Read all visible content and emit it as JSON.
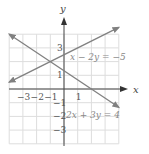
{
  "chart_data": {
    "type": "line",
    "title": "",
    "xlabel": "x",
    "ylabel": "y",
    "xlim": [
      -4,
      4
    ],
    "ylim": [
      -4,
      4
    ],
    "grid": true,
    "x_ticks": [
      "-3",
      "-2",
      "-1",
      "1"
    ],
    "y_ticks": [
      "3",
      "1",
      "-1",
      "-2",
      "-3"
    ],
    "series": [
      {
        "name": "x - 2y = -5",
        "label": "x − 2y = −5",
        "slope": 0.5,
        "intercept": 2.5,
        "x": [
          -4,
          4
        ],
        "y": [
          0.5,
          4.5
        ]
      },
      {
        "name": "2x + 3y = 4",
        "label": "2x + 3y = 4",
        "slope": -0.6667,
        "intercept": 1.3333,
        "x": [
          -4,
          4
        ],
        "y": [
          4,
          -1.3333
        ]
      }
    ],
    "intersection": {
      "x": -1,
      "y": 2
    },
    "colors": {
      "lines": "#808080",
      "grid": "#dddddd",
      "axes": "#444444"
    }
  }
}
